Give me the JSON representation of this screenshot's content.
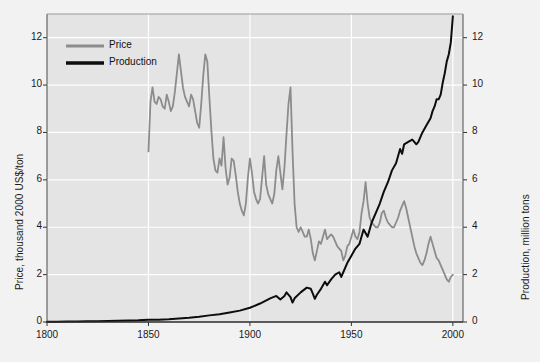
{
  "chart_data": {
    "type": "line",
    "title": "",
    "xlabel": "",
    "ylabel": "Price, thousand 2000 US$/ton",
    "ylabel_right": "Production, million tons",
    "xlim": [
      1800,
      2005
    ],
    "ylim": [
      0,
      13
    ],
    "ylim_right": [
      0,
      13
    ],
    "xticks": [
      1800,
      1850,
      1900,
      1950,
      2000
    ],
    "xticklabels": [
      "1800",
      "1850",
      "1900",
      "1950",
      "2000"
    ],
    "yticks": [
      0,
      2,
      4,
      6,
      8,
      10,
      12
    ],
    "yticklabels": [
      "0",
      "2",
      "4",
      "6",
      "8",
      "10",
      "12"
    ],
    "yticks_right": [
      0,
      2,
      4,
      6,
      8,
      10,
      12
    ],
    "yticklabels_right": [
      "0",
      "2",
      "4",
      "6",
      "8",
      "10",
      "12"
    ],
    "grid": true,
    "grid_color": "#ffffff",
    "legend_position": "upper left",
    "plot_bgcolor": "#e4e4e4",
    "figure_bgcolor": "#f2f2f2",
    "series": [
      {
        "name": "Price",
        "color": "#8c8c8c",
        "axis": "left",
        "units": "thousand 2000 US$/ton",
        "x": [
          1850,
          1851,
          1852,
          1853,
          1854,
          1855,
          1856,
          1857,
          1858,
          1859,
          1860,
          1861,
          1862,
          1863,
          1864,
          1865,
          1866,
          1867,
          1868,
          1869,
          1870,
          1871,
          1872,
          1873,
          1874,
          1875,
          1876,
          1877,
          1878,
          1879,
          1880,
          1881,
          1882,
          1883,
          1884,
          1885,
          1886,
          1887,
          1888,
          1889,
          1890,
          1891,
          1892,
          1893,
          1894,
          1895,
          1896,
          1897,
          1898,
          1899,
          1900,
          1901,
          1902,
          1903,
          1904,
          1905,
          1906,
          1907,
          1908,
          1909,
          1910,
          1911,
          1912,
          1913,
          1914,
          1915,
          1916,
          1917,
          1918,
          1919,
          1920,
          1921,
          1922,
          1923,
          1924,
          1925,
          1926,
          1927,
          1928,
          1929,
          1930,
          1931,
          1932,
          1933,
          1934,
          1935,
          1936,
          1937,
          1938,
          1939,
          1940,
          1941,
          1942,
          1943,
          1944,
          1945,
          1946,
          1947,
          1948,
          1949,
          1950,
          1951,
          1952,
          1953,
          1954,
          1955,
          1956,
          1957,
          1958,
          1959,
          1960,
          1961,
          1962,
          1963,
          1964,
          1965,
          1966,
          1967,
          1968,
          1969,
          1970,
          1971,
          1972,
          1973,
          1974,
          1975,
          1976,
          1977,
          1978,
          1979,
          1980,
          1981,
          1982,
          1983,
          1984,
          1985,
          1986,
          1987,
          1988,
          1989,
          1990,
          1991,
          1992,
          1993,
          1994,
          1995,
          1996,
          1997,
          1998,
          1999,
          2000
        ],
        "y": [
          7.2,
          9.3,
          9.9,
          9.3,
          9.2,
          9.5,
          9.4,
          9.1,
          9.0,
          9.6,
          9.3,
          8.9,
          9.1,
          9.7,
          10.5,
          11.3,
          10.6,
          9.9,
          9.5,
          9.3,
          9.1,
          9.6,
          9.4,
          8.9,
          8.4,
          8.2,
          9.2,
          10.4,
          11.3,
          11.0,
          9.5,
          8.1,
          6.9,
          6.4,
          6.3,
          6.9,
          6.6,
          7.8,
          6.5,
          5.8,
          6.1,
          6.9,
          6.8,
          6.2,
          5.5,
          5.0,
          4.7,
          4.5,
          5.0,
          6.1,
          6.9,
          6.3,
          5.5,
          5.2,
          5.0,
          5.2,
          6.1,
          7.0,
          5.8,
          5.4,
          5.2,
          5.0,
          5.4,
          6.4,
          7.0,
          6.3,
          5.6,
          6.5,
          7.9,
          9.2,
          9.9,
          7.2,
          5.0,
          4.0,
          3.8,
          4.0,
          3.8,
          3.6,
          3.6,
          3.9,
          3.5,
          2.9,
          2.6,
          3.0,
          3.4,
          3.3,
          3.6,
          3.9,
          3.5,
          3.6,
          3.7,
          3.6,
          3.4,
          3.2,
          3.1,
          3.0,
          2.6,
          2.8,
          3.2,
          3.3,
          3.6,
          3.9,
          3.6,
          3.5,
          3.8,
          4.6,
          5.1,
          5.9,
          5.0,
          4.4,
          4.2,
          4.1,
          4.0,
          4.0,
          4.2,
          4.6,
          4.7,
          4.4,
          4.2,
          4.1,
          4.0,
          4.0,
          4.2,
          4.4,
          4.7,
          4.9,
          5.1,
          4.8,
          4.4,
          4.0,
          3.6,
          3.2,
          2.9,
          2.7,
          2.5,
          2.4,
          2.6,
          2.9,
          3.3,
          3.6,
          3.3,
          3.0,
          2.7,
          2.6,
          2.4,
          2.2,
          2.0,
          1.8,
          1.7,
          1.9,
          2.0
        ]
      },
      {
        "name": "Production",
        "color": "#0d0d0d",
        "axis": "right",
        "units": "million tons",
        "x": [
          1800,
          1805,
          1810,
          1815,
          1820,
          1825,
          1830,
          1835,
          1840,
          1845,
          1850,
          1855,
          1860,
          1865,
          1870,
          1875,
          1880,
          1885,
          1890,
          1895,
          1900,
          1905,
          1910,
          1913,
          1915,
          1917,
          1918,
          1920,
          1921,
          1922,
          1925,
          1928,
          1930,
          1931,
          1932,
          1933,
          1935,
          1937,
          1938,
          1940,
          1942,
          1944,
          1945,
          1946,
          1948,
          1950,
          1952,
          1954,
          1956,
          1958,
          1960,
          1962,
          1964,
          1966,
          1968,
          1970,
          1972,
          1974,
          1975,
          1976,
          1978,
          1980,
          1981,
          1982,
          1983,
          1985,
          1987,
          1989,
          1990,
          1991,
          1992,
          1993,
          1994,
          1995,
          1996,
          1997,
          1998,
          1999,
          2000
        ],
        "y": [
          0.01,
          0.01,
          0.02,
          0.02,
          0.03,
          0.03,
          0.04,
          0.05,
          0.06,
          0.07,
          0.09,
          0.1,
          0.12,
          0.15,
          0.18,
          0.22,
          0.28,
          0.33,
          0.4,
          0.48,
          0.6,
          0.78,
          1.0,
          1.1,
          0.95,
          1.1,
          1.25,
          1.05,
          0.82,
          1.0,
          1.25,
          1.45,
          1.4,
          1.2,
          0.98,
          1.15,
          1.4,
          1.7,
          1.55,
          1.8,
          2.0,
          2.1,
          1.9,
          2.1,
          2.5,
          2.8,
          3.1,
          3.3,
          3.9,
          3.6,
          4.2,
          4.6,
          5.0,
          5.5,
          5.9,
          6.4,
          6.7,
          7.3,
          7.1,
          7.5,
          7.6,
          7.7,
          7.6,
          7.5,
          7.6,
          8.0,
          8.3,
          8.6,
          8.9,
          9.1,
          9.4,
          9.4,
          9.6,
          10.1,
          10.5,
          11.0,
          11.3,
          11.8,
          12.9
        ]
      }
    ]
  },
  "legend": {
    "items": [
      {
        "label": "Price",
        "color": "#8c8c8c"
      },
      {
        "label": "Production",
        "color": "#0d0d0d"
      }
    ]
  },
  "axes": {
    "left_title": "Price, thousand 2000 US$/ton",
    "right_title": "Production, million tons"
  }
}
